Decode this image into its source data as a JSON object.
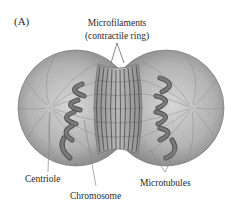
{
  "figure": {
    "panel_label": "(A)",
    "title_line1": "Microfilaments",
    "title_line2": "(contractile ring)",
    "labels": {
      "centriole": "Centriole",
      "chromosome": "Chromosome",
      "microtubules": "Microtubules"
    }
  },
  "colors": {
    "cell_light": "#d2d2d2",
    "cell_mid": "#a9a9a9",
    "cell_dark": "#7d7d7d",
    "chromosome": "#6e6e6e",
    "chromosome_edge": "#4a4a4a",
    "ring_line": "#3a3a3a",
    "text": "#2a2a2a",
    "leader_line": "#8a8a8a"
  }
}
